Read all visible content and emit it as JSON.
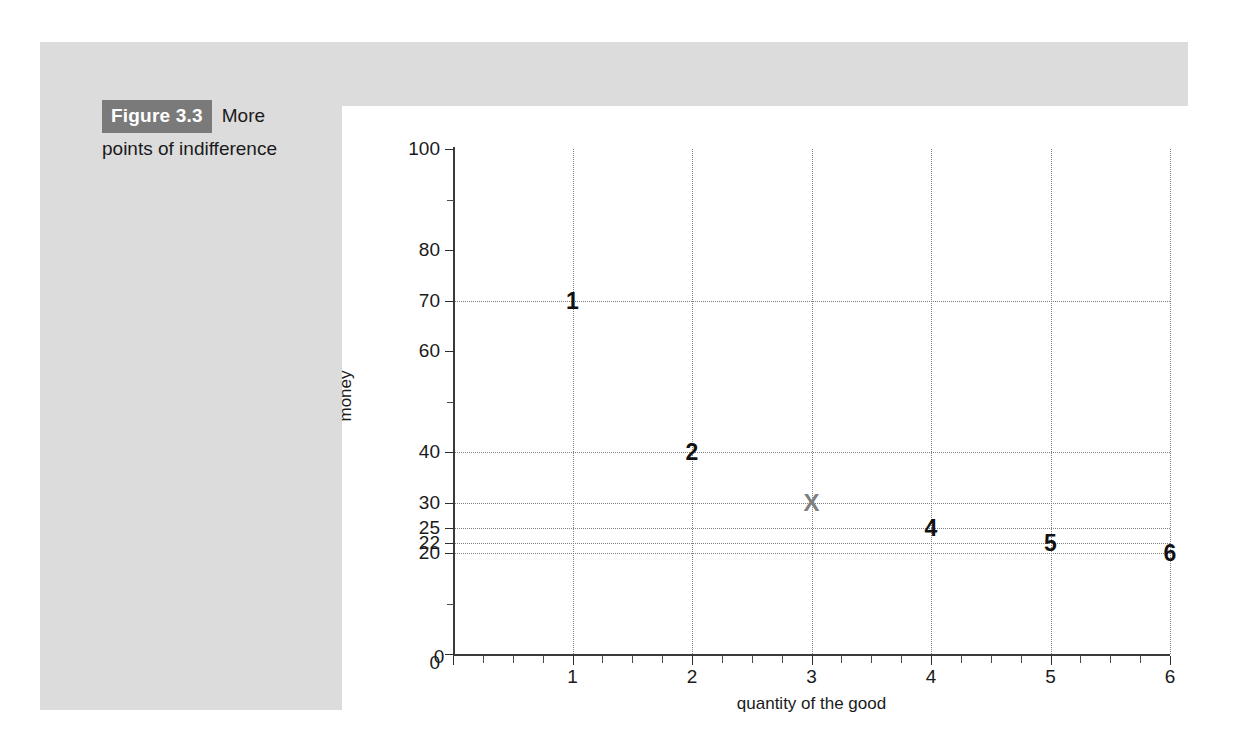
{
  "figure": {
    "number_label": "Figure 3.3",
    "caption_first_line": "More",
    "caption_rest": "points of indifference"
  },
  "colors": {
    "panel_background": "#dcdcdc",
    "card_background": "#ffffff",
    "badge_background": "#7a7a7a",
    "axis": "#3a3a3a",
    "gridline": "#7f7f7f",
    "point_label": "#111111",
    "x_marker": "#808080"
  },
  "chart_data": {
    "type": "scatter",
    "title": "",
    "xlabel": "quantity of the good",
    "ylabel": "money",
    "xlim": [
      0,
      6
    ],
    "ylim": [
      0,
      100
    ],
    "grid": true,
    "legend": "none",
    "x_ticks": [
      0,
      1,
      2,
      3,
      4,
      5,
      6
    ],
    "x_tick_labels": [
      "0",
      "1",
      "2",
      "3",
      "4",
      "5",
      "6"
    ],
    "x_minor_tick_step": 0.25,
    "y_ticks": [
      0,
      20,
      22,
      25,
      30,
      40,
      60,
      70,
      80,
      100
    ],
    "y_tick_labels": [
      "0",
      "20",
      "22",
      "25",
      "30",
      "40",
      "60",
      "70",
      "80",
      "100"
    ],
    "y_minor_ticks": [
      10,
      50,
      90
    ],
    "y_gridlines": [
      20,
      22,
      25,
      30,
      40,
      70
    ],
    "x_gridlines": [
      1,
      2,
      3,
      4,
      5,
      6
    ],
    "points": [
      {
        "label": "1",
        "x": 1,
        "y": 70,
        "marker": "text",
        "color": "#111111"
      },
      {
        "label": "2",
        "x": 2,
        "y": 40,
        "marker": "text",
        "color": "#111111"
      },
      {
        "label": "X",
        "x": 3,
        "y": 30,
        "marker": "text",
        "color": "#808080"
      },
      {
        "label": "4",
        "x": 4,
        "y": 25,
        "marker": "text",
        "color": "#111111"
      },
      {
        "label": "5",
        "x": 5,
        "y": 22,
        "marker": "text",
        "color": "#111111"
      },
      {
        "label": "6",
        "x": 6,
        "y": 20,
        "marker": "text",
        "color": "#111111"
      }
    ]
  }
}
